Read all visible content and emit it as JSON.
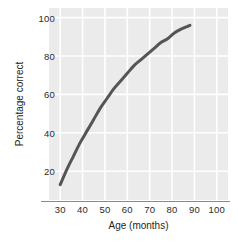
{
  "chart_data": {
    "type": "line",
    "title": "",
    "subtitle": "",
    "xlabel": "Age (months)",
    "ylabel": "Percentage correct",
    "xlim": [
      25,
      105
    ],
    "ylim": [
      5,
      105
    ],
    "xticks": [
      30,
      40,
      50,
      60,
      70,
      80,
      90,
      100
    ],
    "xtick_labels": [
      "30",
      "40",
      "50",
      "60",
      "70",
      "80",
      "90",
      "100"
    ],
    "yticks": [
      20,
      40,
      60,
      80,
      100
    ],
    "ytick_labels": [
      "20",
      "40",
      "60",
      "80",
      "100"
    ],
    "grid": true,
    "grid_color": "#ffffff",
    "plot_background": "#ebebeb",
    "legend": null,
    "legend_position": "none",
    "series": [
      {
        "name": "Percentage correct by age",
        "color": "#555555",
        "line_width": 3,
        "x": [
          30,
          33,
          36,
          39,
          42,
          45,
          48,
          51,
          54,
          57,
          60,
          63,
          66,
          69,
          72,
          75,
          78,
          81,
          84,
          88
        ],
        "values": [
          13,
          21,
          28,
          35,
          41,
          47,
          53,
          58,
          63,
          67,
          71,
          75,
          78,
          81,
          84,
          87,
          89,
          92,
          94,
          96
        ]
      }
    ]
  },
  "axes": {
    "x_title": "Age (months)",
    "y_title": "Percentage correct"
  }
}
